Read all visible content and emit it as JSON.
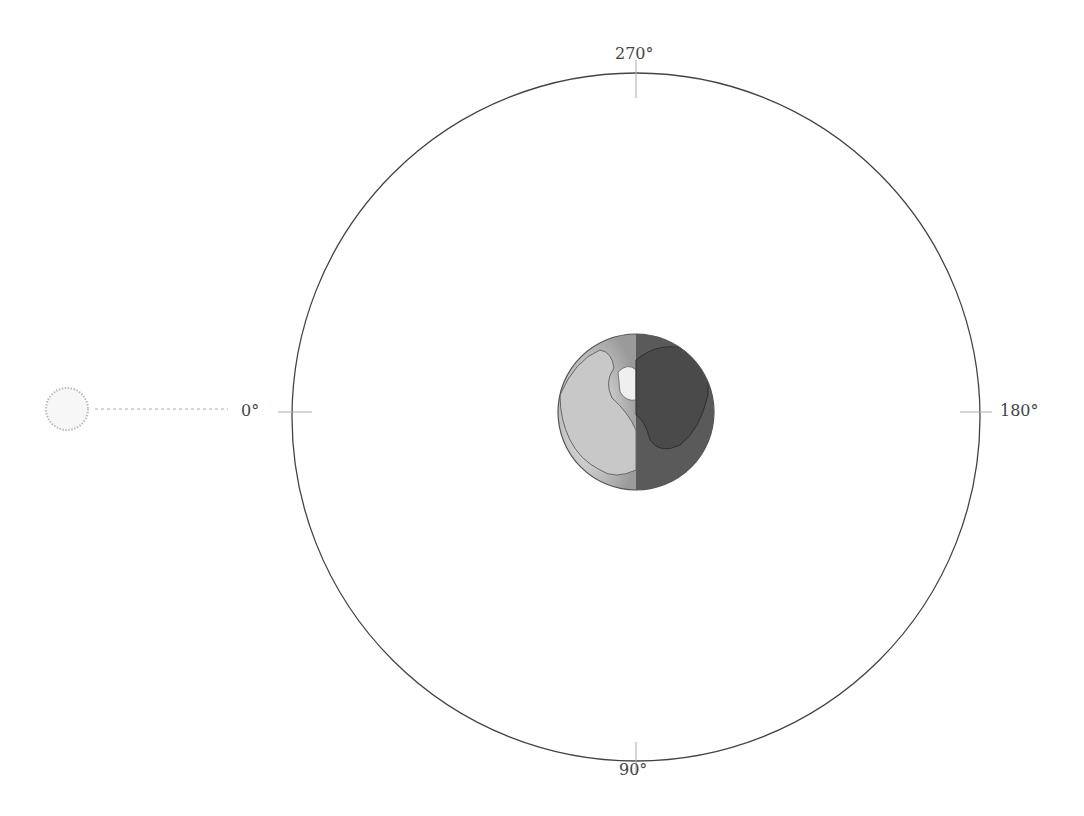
{
  "diagram": {
    "title": "",
    "orbit": {
      "cx": 636,
      "cy": 417,
      "r": 344,
      "stroke": "#444444"
    },
    "earth": {
      "cx": 636,
      "cy": 412,
      "r": 78,
      "day_color": "#bdbdbd",
      "night_color": "#555555"
    },
    "sun": {
      "cx": 67,
      "cy": 409,
      "r": 21,
      "stroke": "#bbbbbb"
    },
    "sun_ray": {
      "from_x": 95,
      "to_x": 228,
      "y": 409
    },
    "angle_labels": [
      {
        "text": "270°",
        "position": "top"
      },
      {
        "text": "90°",
        "position": "bottom"
      },
      {
        "text": "0°",
        "position": "left"
      },
      {
        "text": "180°",
        "position": "right"
      }
    ]
  }
}
